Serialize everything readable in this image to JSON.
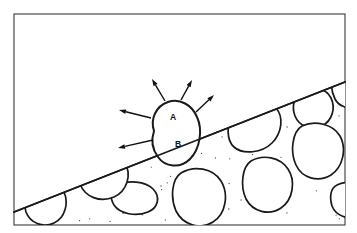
{
  "figure": {
    "background_color": "#ffffff",
    "frame_color": "#3a3a3a",
    "line_color": "#1a1a1a",
    "stipple_color": "#4a4a4a"
  },
  "frame": {
    "x": 14,
    "y": 14,
    "width": 331,
    "height": 211
  },
  "surface_line": {
    "label": "ground-surface",
    "start": {
      "x": 14,
      "y": 212
    },
    "end": {
      "x": 345,
      "y": 82
    }
  },
  "labels": [
    {
      "id": "label-a",
      "text": "A",
      "x": 173,
      "y": 118,
      "region": "above-surface"
    },
    {
      "id": "label-b",
      "text": "B",
      "x": 178,
      "y": 145,
      "region": "below-surface"
    }
  ],
  "main_clast": {
    "name": "central-clast",
    "path": "M 154 131 C 150 119 156 106 168 102 C 180 98 192 105 197 117 C 203 130 200 149 190 159 C 180 169 165 167 158 157 C 152 149 151 140 154 131 Z"
  },
  "arrows": [
    {
      "id": "arrow-up-left",
      "x1": 165,
      "y1": 101,
      "x2": 152,
      "y2": 79,
      "direction": "up-left"
    },
    {
      "id": "arrow-up-right",
      "x1": 181,
      "y1": 100,
      "x2": 192,
      "y2": 80,
      "direction": "up-right"
    },
    {
      "id": "arrow-upper-right",
      "x1": 196,
      "y1": 112,
      "x2": 214,
      "y2": 95,
      "direction": "upper-right"
    },
    {
      "id": "arrow-left",
      "x1": 151,
      "y1": 118,
      "x2": 119,
      "y2": 110,
      "direction": "left"
    },
    {
      "id": "arrow-lower-left",
      "x1": 153,
      "y1": 140,
      "x2": 118,
      "y2": 148,
      "direction": "lower-left"
    }
  ],
  "clasts": [
    {
      "id": "clast-right-upper-truncated",
      "path": "M 242 103 C 252 98 268 99 276 108 C 284 117 282 133 272 143 C 262 153 243 155 234 147 C 226 140 227 124 232 114 C 235 109 238 105 242 103 Z"
    },
    {
      "id": "clast-top-right-corner",
      "path": "M 303 90 C 313 86 326 88 331 98 C 336 108 332 121 322 126 C 311 131 299 126 295 116 C 291 106 295 94 303 90 Z"
    },
    {
      "id": "clast-far-right-edge",
      "path": "M 334 76 C 342 72 352 74 357 82 L 357 106 C 350 110 339 107 335 99 C 331 91 330 80 334 76 Z"
    },
    {
      "id": "clast-right-mid",
      "path": "M 302 126 C 315 120 333 124 340 136 C 347 149 343 167 331 175 C 318 183 302 178 296 165 C 290 152 292 132 302 126 Z"
    },
    {
      "id": "clast-right-lower",
      "path": "M 251 161 C 263 154 280 157 288 169 C 296 181 293 200 281 208 C 269 216 253 212 246 199 C 240 186 242 167 251 161 Z"
    },
    {
      "id": "clast-center-lower",
      "path": "M 181 173 C 194 165 213 168 221 181 C 229 194 226 214 213 222 C 200 230 183 225 176 211 C 170 197 172 179 181 173 Z"
    },
    {
      "id": "clast-center-low-small",
      "path": "M 118 185 C 128 180 145 181 153 189 C 161 197 158 208 148 212 C 136 217 120 214 114 205 C 109 197 111 188 118 185 Z"
    },
    {
      "id": "clast-left-mid",
      "path": "M 86 154 C 99 148 118 151 125 163 C 132 175 127 191 114 197 C 100 203 85 197 80 184 C 75 171 78 158 86 154 Z"
    },
    {
      "id": "clast-left-lower-truncated",
      "path": "M 36 184 C 46 179 59 182 64 192 C 69 203 65 218 54 223 C 43 228 30 223 26 212 C 23 201 28 188 36 184 Z"
    },
    {
      "id": "clast-bottom-right-edge",
      "path": "M 337 185 C 346 180 357 183 357 193 L 357 216 C 348 220 336 216 332 206 C 329 196 331 188 337 185 Z"
    }
  ],
  "stipple": {
    "name": "sediment-stipple",
    "dot_count": 170,
    "dot_radius": 0.65,
    "seed": 20240517
  }
}
